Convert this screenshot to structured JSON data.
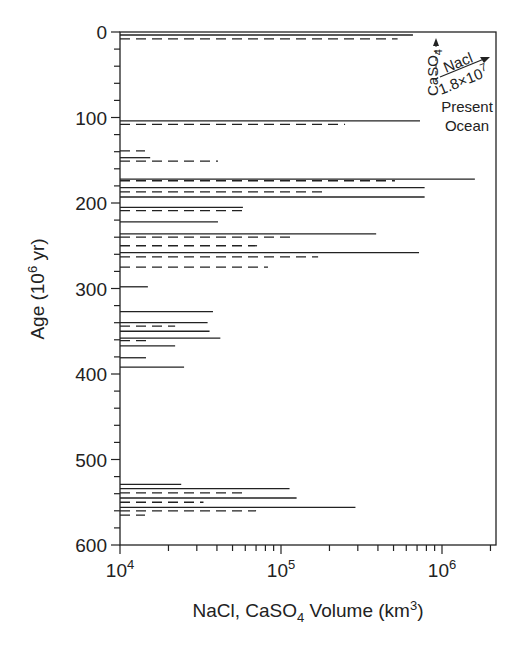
{
  "chart_data": {
    "type": "bar",
    "orientation": "horizontal-lines",
    "title": "",
    "xlabel": "NaCl, CaSO4 Volume (km3)",
    "xlabel_parts": {
      "pre": "NaCl, CaSO",
      "sub": "4",
      "mid": " Volume (km",
      "sup": "3",
      "post": ")"
    },
    "ylabel": "Age (10^6 yr)",
    "ylabel_parts": {
      "pre": "Age (10",
      "sup": "6",
      "post": " yr)"
    },
    "xscale": "log",
    "xlim": [
      10000,
      2160000
    ],
    "ylim": [
      0,
      600
    ],
    "y_inverted": true,
    "grid": false,
    "x_ticks": [
      {
        "value": 10000,
        "base": "10",
        "exp": "4"
      },
      {
        "value": 100000,
        "base": "10",
        "exp": "5"
      },
      {
        "value": 1000000,
        "base": "10",
        "exp": "6"
      }
    ],
    "y_ticks": [
      "0",
      "100",
      "200",
      "300",
      "400",
      "500",
      "600"
    ],
    "y_minor_step": 20,
    "legend": [
      {
        "name": "NaCl",
        "style": "solid"
      },
      {
        "name": "CaSO4",
        "style": "dashed"
      }
    ],
    "annotations": {
      "caso4_label": "CaSO",
      "caso4_sub": "4",
      "nacl_label": "Nacl",
      "ocean_value_base": "1.8×10",
      "ocean_value_exp": "7",
      "present_label": "Present",
      "ocean_label": "Ocean"
    },
    "series": [
      {
        "name": "NaCl",
        "style": "solid",
        "points": [
          {
            "age": 3.5,
            "volume": 660000
          },
          {
            "age": 104,
            "volume": 730000
          },
          {
            "age": 147,
            "volume": 15400
          },
          {
            "age": 172,
            "volume": 1600000
          },
          {
            "age": 182,
            "volume": 780000
          },
          {
            "age": 193,
            "volume": 780000
          },
          {
            "age": 205,
            "volume": 58000
          },
          {
            "age": 222,
            "volume": 40600
          },
          {
            "age": 236,
            "volume": 390000
          },
          {
            "age": 258,
            "volume": 720000
          },
          {
            "age": 298,
            "volume": 14900
          },
          {
            "age": 327,
            "volume": 37800
          },
          {
            "age": 340,
            "volume": 35000
          },
          {
            "age": 350,
            "volume": 36000
          },
          {
            "age": 358,
            "volume": 42000
          },
          {
            "age": 367,
            "volume": 22000
          },
          {
            "age": 381,
            "volume": 14500
          },
          {
            "age": 392,
            "volume": 25000
          },
          {
            "age": 529,
            "volume": 24000
          },
          {
            "age": 534,
            "volume": 113000
          },
          {
            "age": 545,
            "volume": 125000
          },
          {
            "age": 556,
            "volume": 290000
          }
        ]
      },
      {
        "name": "CaSO4",
        "style": "dashed",
        "points": [
          {
            "age": 8,
            "volume": 530000
          },
          {
            "age": 108,
            "volume": 250000
          },
          {
            "age": 139,
            "volume": 14300
          },
          {
            "age": 151,
            "volume": 40600
          },
          {
            "age": 174,
            "volume": 510000
          },
          {
            "age": 187,
            "volume": 190000
          },
          {
            "age": 209,
            "volume": 61000
          },
          {
            "age": 240,
            "volume": 117000
          },
          {
            "age": 250,
            "volume": 71000
          },
          {
            "age": 263,
            "volume": 170000
          },
          {
            "age": 275,
            "volume": 83000
          },
          {
            "age": 344,
            "volume": 22000
          },
          {
            "age": 361,
            "volume": 14900
          },
          {
            "age": 539,
            "volume": 60000
          },
          {
            "age": 550,
            "volume": 33000
          },
          {
            "age": 560,
            "volume": 70000
          },
          {
            "age": 565,
            "volume": 14300
          }
        ]
      }
    ]
  }
}
